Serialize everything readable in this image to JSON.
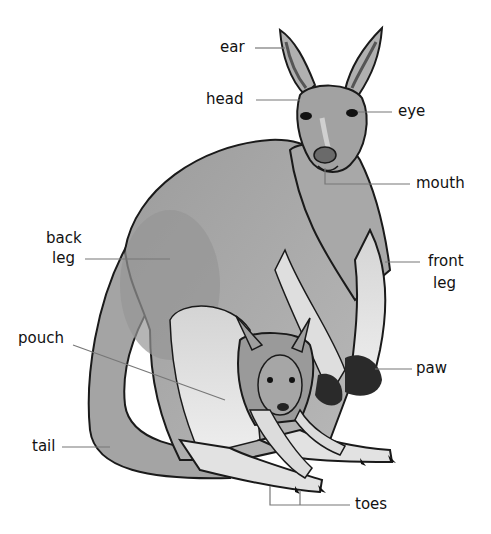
{
  "diagram": {
    "labels": {
      "ear": "ear",
      "head": "head",
      "eye": "eye",
      "mouth": "mouth",
      "back_leg_1": "back",
      "back_leg_2": "leg",
      "front_leg_1": "front",
      "front_leg_2": "leg",
      "pouch": "pouch",
      "paw": "paw",
      "tail": "tail",
      "toes": "toes"
    },
    "colors": {
      "fur_dark": "#8a8a8a",
      "fur_mid": "#a9a9a9",
      "fur_light": "#d9d9d9",
      "outline": "#1a1a1a",
      "leader": "#777777",
      "text": "#111111"
    }
  }
}
